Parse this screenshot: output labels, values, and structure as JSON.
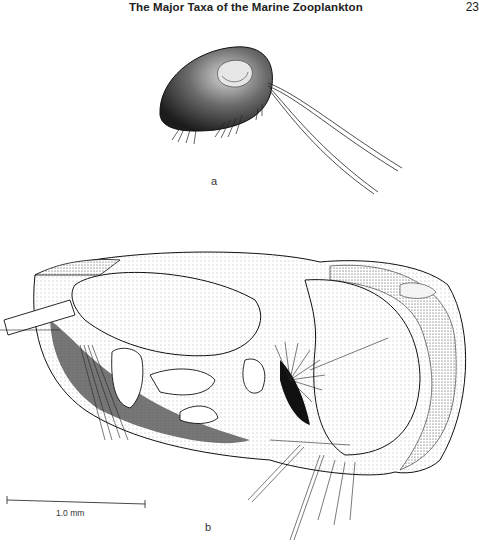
{
  "header": {
    "running_title": "The Major Taxa of the Marine Zooplankton",
    "page_number": "23"
  },
  "figures": {
    "a": {
      "label": "a",
      "subject": "ostracod-whole-animal"
    },
    "b": {
      "label": "b",
      "subject": "ostracod-detailed-lateral-view"
    }
  },
  "scale_bar": {
    "label": "1.0 mm"
  }
}
